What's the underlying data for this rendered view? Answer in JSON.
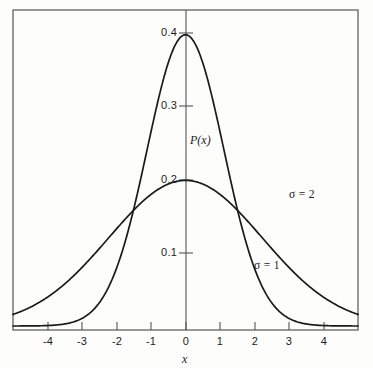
{
  "figure": {
    "background_color": "#fdfdfc",
    "line_color": "#1a1a1a",
    "frame_color": "#4a4a4a"
  },
  "chart_data": {
    "type": "line",
    "title": "",
    "subtitle": "",
    "xlabel": "x",
    "ylabel": "P(x)",
    "xlim": [
      -4.5,
      4.5
    ],
    "ylim": [
      0,
      0.44
    ],
    "grid": false,
    "legend_position": "inline-annotations",
    "x_ticks": [
      -4,
      -3,
      -2,
      -1,
      0,
      1,
      2,
      3,
      4
    ],
    "x_tick_labels": [
      "-4",
      "-3",
      "-2",
      "-1",
      "0",
      "1",
      "2",
      "3",
      "4"
    ],
    "y_ticks": [
      0.1,
      0.2,
      0.3,
      0.4
    ],
    "y_tick_labels": [
      "0.1",
      "0.2",
      "0.3",
      "0.4"
    ],
    "annotations": [
      {
        "text": "σ = 2",
        "x": 2.55,
        "y": 0.168
      },
      {
        "text": "σ = 1",
        "x": 1.65,
        "y": 0.098
      }
    ],
    "series": [
      {
        "name": "σ = 1",
        "sigma": 1,
        "mu": 0,
        "peak_value": 0.3989,
        "x": [
          -4.5,
          -4.0,
          -3.5,
          -3.2,
          -3.0,
          -2.75,
          -2.5,
          -2.25,
          -2.0,
          -1.75,
          -1.5,
          -1.25,
          -1.0,
          -0.75,
          -0.5,
          -0.25,
          0,
          0.25,
          0.5,
          0.75,
          1.0,
          1.25,
          1.5,
          1.75,
          2.0,
          2.25,
          2.5,
          2.75,
          3.0,
          3.2,
          3.5,
          4.0,
          4.5
        ],
        "values": [
          1.6e-05,
          0.000134,
          0.000873,
          0.00238,
          0.00443,
          0.00909,
          0.0175,
          0.0317,
          0.054,
          0.0863,
          0.1295,
          0.1826,
          0.242,
          0.3011,
          0.3521,
          0.3867,
          0.3989,
          0.3867,
          0.3521,
          0.3011,
          0.242,
          0.1826,
          0.1295,
          0.0863,
          0.054,
          0.0317,
          0.0175,
          0.00909,
          0.00443,
          0.00238,
          0.000873,
          0.000134,
          1.6e-05
        ]
      },
      {
        "name": "σ = 2",
        "sigma": 2,
        "mu": 0,
        "peak_value": 0.1995,
        "x": [
          -4.5,
          -4.0,
          -3.5,
          -3.0,
          -2.5,
          -2.0,
          -1.5,
          -1.0,
          -0.5,
          0,
          0.5,
          1.0,
          1.5,
          2.0,
          2.5,
          3.0,
          3.5,
          4.0,
          4.5
        ],
        "values": [
          0.0725,
          0.09,
          0.1074,
          0.124,
          0.1388,
          0.151,
          0.1601,
          0.176,
          0.1931,
          0.1995,
          0.1931,
          0.176,
          0.1601,
          0.151,
          0.1388,
          0.124,
          0.1074,
          0.09,
          0.0725
        ]
      }
    ]
  },
  "labels": {
    "y_axis_name": "P(x)",
    "x_axis_name": "x",
    "sigma_two": "σ = 2",
    "sigma_one": "σ = 1",
    "y_0_4": "0.4",
    "y_0_3": "0.3",
    "y_0_2": "0.2",
    "y_0_1": "0.1",
    "x_m4": "-4",
    "x_m3": "-3",
    "x_m2": "-2",
    "x_m1": "-1",
    "x_0": "0",
    "x_1": "1",
    "x_2": "2",
    "x_3": "3",
    "x_4": "4"
  }
}
